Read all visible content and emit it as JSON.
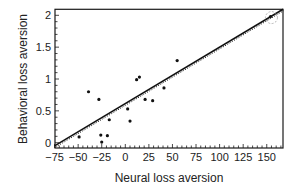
{
  "chart_data": {
    "type": "scatter",
    "title": "",
    "xlabel": "Neural loss aversion",
    "ylabel": "Behavioral loss aversion",
    "xlim": [
      -75,
      167
    ],
    "ylim": [
      -0.07,
      2.1
    ],
    "xticks": [
      -75,
      -50,
      -25,
      0,
      25,
      50,
      75,
      100,
      125,
      150
    ],
    "xtick_labels": [
      "−75",
      "−50",
      "−25",
      "0",
      "25",
      "50",
      "75",
      "100",
      "125",
      "150"
    ],
    "yticks": [
      0,
      0.5,
      1,
      1.5,
      2
    ],
    "ytick_labels": [
      "0",
      "0.5",
      "1",
      "1.5",
      "2"
    ],
    "grid": false,
    "legend": null,
    "points": [
      {
        "x": -49,
        "y": 0.09
      },
      {
        "x": -39,
        "y": 0.8
      },
      {
        "x": -28,
        "y": 0.68
      },
      {
        "x": -26,
        "y": 0.12
      },
      {
        "x": -25,
        "y": 0.01
      },
      {
        "x": -19,
        "y": 0.11
      },
      {
        "x": -17,
        "y": 0.36
      },
      {
        "x": 2.5,
        "y": 0.53
      },
      {
        "x": 5,
        "y": 0.34
      },
      {
        "x": 12,
        "y": 0.99
      },
      {
        "x": 15,
        "y": 1.03
      },
      {
        "x": 21,
        "y": 0.68
      },
      {
        "x": 29,
        "y": 0.66
      },
      {
        "x": 41,
        "y": 0.86
      },
      {
        "x": 55,
        "y": 1.29
      },
      {
        "x": 154,
        "y": 1.98
      }
    ],
    "fit_line": {
      "x0": -75,
      "y0": -0.05,
      "x1": 167,
      "y1": 2.1
    },
    "annotations": [
      {
        "type": "dashed-circle",
        "x": 155,
        "y": 1.98,
        "note": "outlier point circled"
      }
    ]
  },
  "colors": {
    "axis": "#1a1a1a",
    "points": "#111111",
    "line": "#111111",
    "background": "#ffffff",
    "circle": "#999999"
  }
}
